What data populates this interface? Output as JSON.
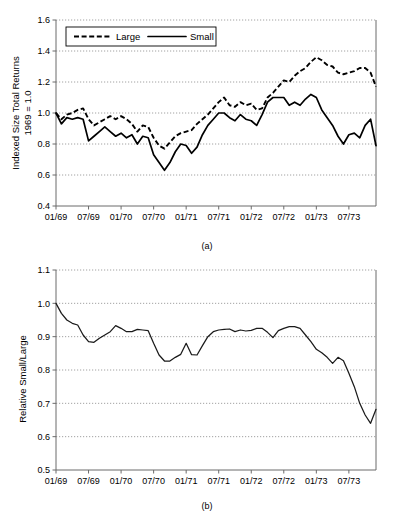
{
  "figure": {
    "panels": [
      {
        "caption": "(a)",
        "ylabel_line1": "Indexed Size Total Returns",
        "ylabel_line2": "1969 = 1.0"
      },
      {
        "caption": "(b)",
        "ylabel_line1": "Relative Small/Large",
        "ylabel_line2": ""
      }
    ]
  },
  "chart_data": [
    {
      "type": "line",
      "title": "",
      "panel": "(a)",
      "xlabel": "",
      "ylabel": "Indexed Size Total Returns 1969 = 1.0",
      "ylim": [
        0.4,
        1.6
      ],
      "yticks": [
        0.4,
        0.6,
        0.8,
        1.0,
        1.2,
        1.4,
        1.6
      ],
      "ytick_labels": [
        "0.4",
        "0.6",
        "0.8",
        "1.0",
        "1.2",
        "1.4",
        "1.6"
      ],
      "xticks": [
        "01/69",
        "07/69",
        "01/70",
        "07/70",
        "01/71",
        "07/71",
        "01/72",
        "07/72",
        "01/73",
        "07/73"
      ],
      "xtick_positions": [
        0,
        6,
        12,
        18,
        24,
        30,
        36,
        42,
        48,
        54
      ],
      "x_range": [
        0,
        59
      ],
      "grid": "horizontal-dotted",
      "legend": {
        "position": "upper-left-inside",
        "entries": [
          {
            "label": "Large",
            "style": "dashed"
          },
          {
            "label": "Small",
            "style": "solid"
          }
        ]
      },
      "x": [
        0,
        1,
        2,
        3,
        4,
        5,
        6,
        7,
        8,
        9,
        10,
        11,
        12,
        13,
        14,
        15,
        16,
        17,
        18,
        19,
        20,
        21,
        22,
        23,
        24,
        25,
        26,
        27,
        28,
        29,
        30,
        31,
        32,
        33,
        34,
        35,
        36,
        37,
        38,
        39,
        40,
        41,
        42,
        43,
        44,
        45,
        46,
        47,
        48,
        49,
        50,
        51,
        52,
        53,
        54,
        55,
        56,
        57,
        58,
        59
      ],
      "series": [
        {
          "name": "Large",
          "style": "dashed",
          "values": [
            1.0,
            0.96,
            0.99,
            1.0,
            1.02,
            1.03,
            0.96,
            0.92,
            0.94,
            0.96,
            0.98,
            0.96,
            0.98,
            0.96,
            0.93,
            0.88,
            0.92,
            0.91,
            0.84,
            0.79,
            0.77,
            0.81,
            0.85,
            0.87,
            0.88,
            0.89,
            0.93,
            0.96,
            0.99,
            1.03,
            1.07,
            1.1,
            1.05,
            1.04,
            1.07,
            1.05,
            1.06,
            1.02,
            1.03,
            1.1,
            1.13,
            1.17,
            1.21,
            1.2,
            1.24,
            1.27,
            1.29,
            1.33,
            1.36,
            1.34,
            1.31,
            1.3,
            1.26,
            1.25,
            1.26,
            1.27,
            1.29,
            1.29,
            1.26,
            1.17
          ]
        },
        {
          "name": "Small",
          "style": "solid",
          "values": [
            1.0,
            0.93,
            0.97,
            0.96,
            0.97,
            0.96,
            0.82,
            0.85,
            0.88,
            0.91,
            0.88,
            0.85,
            0.87,
            0.84,
            0.86,
            0.8,
            0.85,
            0.84,
            0.73,
            0.68,
            0.63,
            0.68,
            0.75,
            0.8,
            0.79,
            0.74,
            0.78,
            0.86,
            0.92,
            0.96,
            1.0,
            1.0,
            0.97,
            0.95,
            0.99,
            0.96,
            0.95,
            0.92,
            0.99,
            1.07,
            1.1,
            1.1,
            1.1,
            1.05,
            1.07,
            1.05,
            1.09,
            1.12,
            1.1,
            1.02,
            0.97,
            0.92,
            0.85,
            0.8,
            0.86,
            0.87,
            0.84,
            0.92,
            0.96,
            0.79
          ]
        }
      ]
    },
    {
      "type": "line",
      "title": "",
      "panel": "(b)",
      "xlabel": "",
      "ylabel": "Relative Small/Large",
      "ylim": [
        0.5,
        1.1
      ],
      "yticks": [
        0.5,
        0.6,
        0.7,
        0.8,
        0.9,
        1.0,
        1.1
      ],
      "ytick_labels": [
        "0.5",
        "0.6",
        "0.7",
        "0.8",
        "0.9",
        "1.0",
        "1.1"
      ],
      "xticks": [
        "01/69",
        "07/69",
        "01/70",
        "07/70",
        "01/71",
        "07/71",
        "01/72",
        "07/72",
        "01/73",
        "07/73"
      ],
      "xtick_positions": [
        0,
        6,
        12,
        18,
        24,
        30,
        36,
        42,
        48,
        54
      ],
      "x_range": [
        0,
        59
      ],
      "grid": "horizontal-dotted",
      "legend": null,
      "x": [
        0,
        1,
        2,
        3,
        4,
        5,
        6,
        7,
        8,
        9,
        10,
        11,
        12,
        13,
        14,
        15,
        16,
        17,
        18,
        19,
        20,
        21,
        22,
        23,
        24,
        25,
        26,
        27,
        28,
        29,
        30,
        31,
        32,
        33,
        34,
        35,
        36,
        37,
        38,
        39,
        40,
        41,
        42,
        43,
        44,
        45,
        46,
        47,
        48,
        49,
        50,
        51,
        52,
        53,
        54,
        55,
        56,
        57,
        58,
        59
      ],
      "series": [
        {
          "name": "Relative Small/Large",
          "style": "solid-thin",
          "values": [
            1.0,
            0.97,
            0.95,
            0.94,
            0.935,
            0.905,
            0.885,
            0.883,
            0.895,
            0.905,
            0.915,
            0.933,
            0.925,
            0.915,
            0.915,
            0.922,
            0.92,
            0.918,
            0.88,
            0.845,
            0.827,
            0.827,
            0.838,
            0.847,
            0.88,
            0.846,
            0.845,
            0.873,
            0.9,
            0.915,
            0.92,
            0.922,
            0.923,
            0.915,
            0.92,
            0.917,
            0.919,
            0.925,
            0.925,
            0.913,
            0.897,
            0.918,
            0.925,
            0.93,
            0.93,
            0.925,
            0.905,
            0.885,
            0.862,
            0.852,
            0.838,
            0.82,
            0.838,
            0.828,
            0.79,
            0.75,
            0.7,
            0.665,
            0.64,
            0.682
          ]
        }
      ]
    }
  ]
}
